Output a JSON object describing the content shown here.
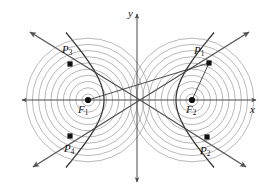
{
  "figure": {
    "type": "geometry-diagram",
    "background_color": "#ffffff",
    "circle_color": "#9a9a9a",
    "axis_color": "#4a4a4a",
    "curve_color": "#3a3a3a",
    "asymptote_color": "#555555",
    "point_color": "#111111",
    "label_color": "#111111"
  },
  "axes": {
    "x_label": "x",
    "y_label": "y",
    "x_axis": {
      "y": 100,
      "x_start": 22,
      "x_end": 256,
      "arrows": "both"
    },
    "y_axis": {
      "x": 137,
      "y_start": 14,
      "y_end": 182,
      "arrows": "both"
    }
  },
  "foci": [
    {
      "id": "F1",
      "label": "F",
      "sub": "1",
      "x": 88,
      "y": 100,
      "label_x": 78,
      "label_y": 104
    },
    {
      "id": "F2",
      "label": "F",
      "sub": "2",
      "x": 192,
      "y": 100,
      "label_x": 186,
      "label_y": 104
    }
  ],
  "points": [
    {
      "id": "P1",
      "label": "P",
      "sub": "1",
      "x": 209,
      "y": 63,
      "label_x": 194,
      "label_y": 45
    },
    {
      "id": "P2",
      "label": "P",
      "sub": "2",
      "x": 207,
      "y": 137,
      "label_x": 200,
      "label_y": 145
    },
    {
      "id": "P3",
      "label": "P",
      "sub": "3",
      "x": 70,
      "y": 64,
      "label_x": 62,
      "label_y": 44
    },
    {
      "id": "P4",
      "label": "P",
      "sub": "4",
      "x": 70,
      "y": 136,
      "label_x": 64,
      "label_y": 143
    }
  ],
  "circles": {
    "count_per_focus": 10,
    "min_radius": 6,
    "spacing": 6.2,
    "centers": [
      [
        88,
        100
      ],
      [
        192,
        100
      ]
    ]
  },
  "hyperbola": {
    "center_x": 140,
    "center_y": 100,
    "a": 36,
    "c": 52,
    "vertices": [
      [
        104,
        100
      ],
      [
        176,
        100
      ]
    ]
  },
  "asymptotes": [
    {
      "from": [
        140,
        100
      ],
      "to": [
        30,
        32
      ],
      "arrow": true
    },
    {
      "from": [
        140,
        100
      ],
      "to": [
        249,
        32
      ],
      "arrow": true
    },
    {
      "from": [
        140,
        100
      ],
      "to": [
        33,
        167
      ],
      "arrow": true
    },
    {
      "from": [
        140,
        100
      ],
      "to": [
        246,
        167
      ],
      "arrow": true
    }
  ],
  "focal_radii": [
    {
      "from": "F1",
      "to": "P1"
    },
    {
      "from": "F2",
      "to": "P1"
    }
  ]
}
